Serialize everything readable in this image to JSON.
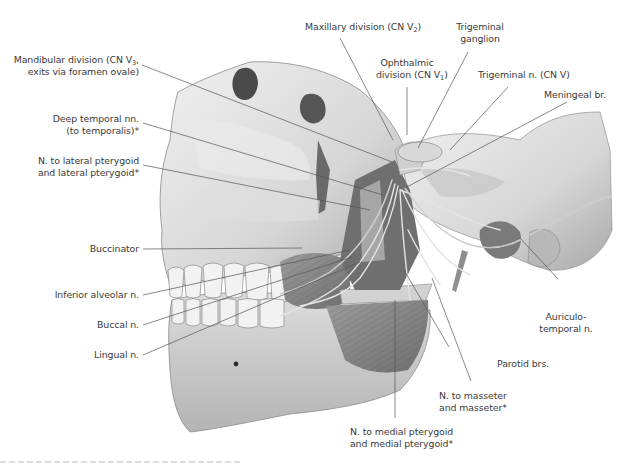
{
  "figure": {
    "colors": {
      "background": "#ffffff",
      "label_text": "#3a3a3a",
      "leader_line": "#555555",
      "bone_light": "#e6e6e6",
      "bone_shadow": "#9a9a9a",
      "muscle": "#8c8c8c"
    }
  },
  "labels": {
    "mandibular_division": {
      "line1": "Mandibular division (CN V",
      "sub": "3",
      "line1_end": ",",
      "line2": "exits via foramen ovale)"
    },
    "deep_temporal": {
      "line1": "Deep temporal nn.",
      "line2": "(to temporalis)*"
    },
    "lateral_pterygoid": {
      "line1": "N. to lateral pterygoid",
      "line2": "and lateral pterygoid*"
    },
    "buccinator": {
      "line1": "Buccinator"
    },
    "inferior_alveolar": {
      "line1": "Inferior alveolar n."
    },
    "buccal": {
      "line1": "Buccal n."
    },
    "lingual": {
      "line1": "Lingual n."
    },
    "maxillary_division": {
      "line1": "Maxillary division (CN V",
      "sub": "2",
      "line1_end": ")"
    },
    "ophthalmic_division": {
      "line1": "Ophthalmic",
      "line2": "division (CN V",
      "sub": "1",
      "line2_end": ")"
    },
    "trigeminal_ganglion": {
      "line1": "Trigeminal",
      "line2": "ganglion"
    },
    "trigeminal_nerve": {
      "line1": "Trigeminal n. (CN V)"
    },
    "meningeal_branch": {
      "line1": "Meningeal br."
    },
    "auriculotemporal": {
      "line1": "Auriculo-",
      "line2": "temporal n."
    },
    "parotid_branches": {
      "line1": "Parotid brs."
    },
    "masseter": {
      "line1": "N. to masseter",
      "line2": "and masseter*"
    },
    "medial_pterygoid": {
      "line1": "N. to medial pterygoid",
      "line2": "and medial pterygoid*"
    }
  }
}
